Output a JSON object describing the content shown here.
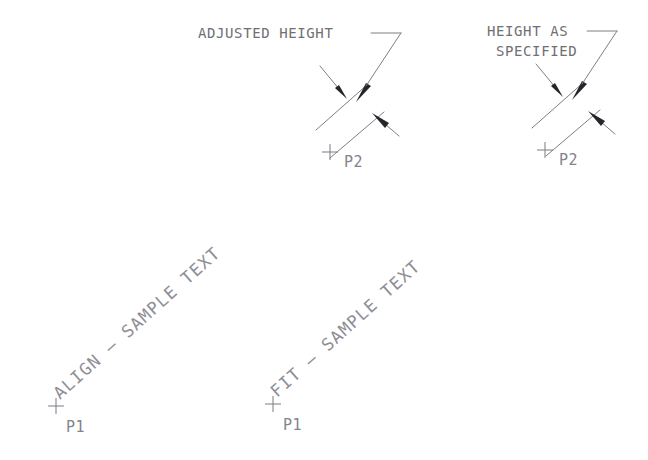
{
  "diagram": {
    "background_color": "#ffffff",
    "line_color": "#7e7e86",
    "text_color": "#83838a",
    "arrow_color": "#26262a",
    "width": 648,
    "height": 460
  },
  "annotations": {
    "left_callout_line1": "ADJUSTED HEIGHT",
    "left_callout_line2": "",
    "right_callout_line1": "HEIGHT AS",
    "right_callout_line2": "SPECIFIED"
  },
  "left_group": {
    "name": "align-example",
    "sample_text": "ALIGN  —  SAMPLE TEXT",
    "sample_text_plain": "ALIGN - SAMPLE TEXT",
    "point_start_label": "P1",
    "point_end_label": "P2",
    "rotation_degrees": -42
  },
  "right_group": {
    "name": "fit-example",
    "sample_text": "FIT  —  SAMPLE TEXT",
    "sample_text_plain": "FIT - SAMPLE TEXT",
    "point_start_label": "P1",
    "point_end_label": "P2",
    "rotation_degrees": -42
  },
  "markers": {
    "cross_glyph": "+"
  }
}
